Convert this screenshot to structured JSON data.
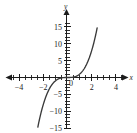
{
  "chart_data": {
    "type": "line",
    "title": "",
    "subtitle": "",
    "xlabel": "x",
    "ylabel": "y",
    "xlim": [
      -4.6,
      4.8
    ],
    "ylim": [
      -16.2,
      16.6
    ],
    "grid": false,
    "legend": null,
    "x_ticks": [
      -4,
      -2,
      0,
      2,
      4
    ],
    "x_tick_labels": [
      "−4",
      "−2",
      "0",
      "2",
      "4"
    ],
    "x_minor_tick_step": 0.5,
    "y_ticks": [
      15,
      10,
      5,
      -5,
      -10,
      -15
    ],
    "y_tick_labels": [
      "15",
      "10",
      "5",
      "−5",
      "−10",
      "−15"
    ],
    "y_minor_tick_step": 1,
    "series": [
      {
        "name": "y = x³",
        "color": "#3a3a3a",
        "x": [
          -2.45,
          -2.3,
          -2.1,
          -1.9,
          -1.7,
          -1.5,
          -1.3,
          -1.1,
          -0.9,
          -0.7,
          -0.5,
          -0.3,
          -0.1,
          0,
          0.1,
          0.3,
          0.5,
          0.7,
          0.9,
          1.1,
          1.3,
          1.5,
          1.7,
          1.9,
          2.1,
          2.3,
          2.45
        ],
        "y": [
          -14.7,
          -12.17,
          -9.26,
          -6.86,
          -4.91,
          -3.38,
          -2.2,
          -1.33,
          -0.73,
          -0.34,
          -0.13,
          -0.03,
          0,
          0,
          0,
          0.03,
          0.13,
          0.34,
          0.73,
          1.33,
          2.2,
          3.38,
          4.91,
          6.86,
          9.26,
          12.17,
          14.7
        ]
      }
    ]
  },
  "axes": {
    "x_axis_name": "x",
    "y_axis_name": "y",
    "origin_label": "0"
  },
  "geometry": {
    "origin_px": {
      "x": 67,
      "y": 77
    },
    "x_unit_px": 12.1,
    "y_unit_px": 3.37
  }
}
